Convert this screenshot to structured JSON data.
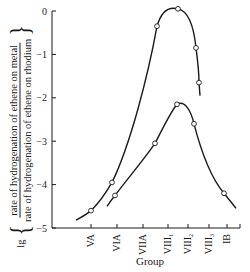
{
  "chart_data": {
    "type": "line",
    "title": "",
    "xlabel": "Group",
    "ylabel": "lg { rate of hydrogenation of ethene on metal / rate of hydrogenation of ethene on rhodium }",
    "ylabel_parts": {
      "prefix": "lg",
      "numerator": "rate of hydrogenation of ethene on metal",
      "denominator": "rate of hydrogenation of ethene on rhodium"
    },
    "categories": [
      "VA",
      "VIA",
      "VIIA",
      "VIII1",
      "VIII2",
      "VIII3",
      "IB"
    ],
    "category_labels": [
      {
        "main": "VA",
        "sub": ""
      },
      {
        "main": "VIA",
        "sub": ""
      },
      {
        "main": "VIIA",
        "sub": ""
      },
      {
        "main": "VIII",
        "sub": "1"
      },
      {
        "main": "VIII",
        "sub": "2"
      },
      {
        "main": "VIII",
        "sub": "3"
      },
      {
        "main": "IB",
        "sub": ""
      }
    ],
    "yticks": [
      "0",
      "-1",
      "-2",
      "-3",
      "-4",
      "-5"
    ],
    "ylim": [
      -5,
      0
    ],
    "grid": false,
    "legend": null,
    "series": [
      {
        "name": "upper curve",
        "points": [
          {
            "x": "VA",
            "y": -4.6
          },
          {
            "x": "VIA",
            "y": -3.95
          },
          {
            "x": "VIIA/VIII1",
            "y": -0.35
          },
          {
            "x": "VIII1",
            "y": 0.05
          },
          {
            "x": "VIII2",
            "y": -0.85
          },
          {
            "x": "VIII2",
            "y": -1.65
          }
        ]
      },
      {
        "name": "lower curve",
        "points": [
          {
            "x": "VIA",
            "y": -4.25
          },
          {
            "x": "VIIA",
            "y": -3.05
          },
          {
            "x": "VIII1",
            "y": -2.15
          },
          {
            "x": "VIII2",
            "y": -2.6
          },
          {
            "x": "IB",
            "y": -4.2
          }
        ]
      }
    ]
  }
}
